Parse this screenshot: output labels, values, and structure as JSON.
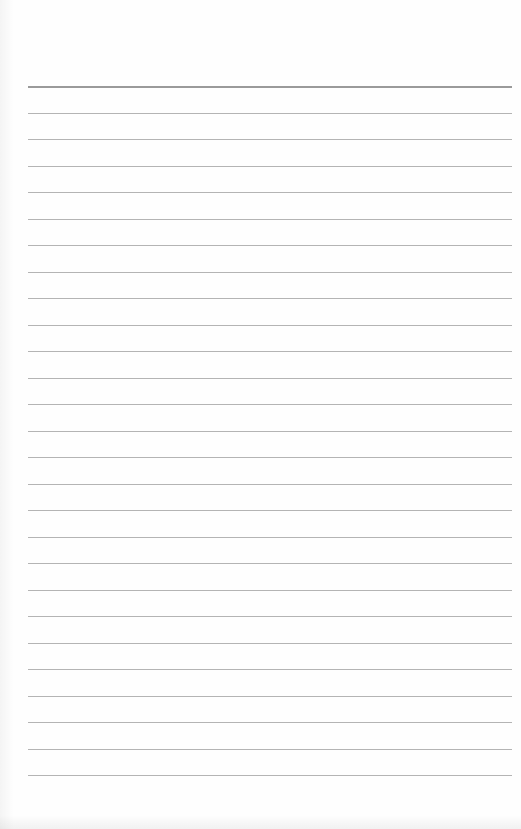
{
  "document": {
    "type": "lined-paper",
    "background_color": "#fefefe",
    "rule_color": "#b4b4b4",
    "top_rule_color": "#9a9a9a",
    "rule_count": 27,
    "first_rule_y": 86,
    "rule_spacing": 26.5,
    "rule_left": 28,
    "rule_width": 484
  }
}
